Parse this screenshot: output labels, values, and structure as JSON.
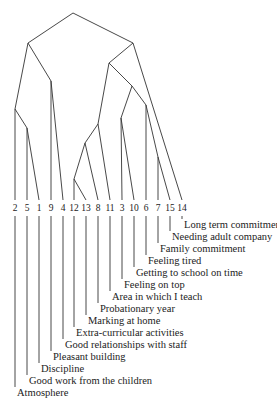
{
  "diagram": {
    "type": "dendrogram",
    "leaves": [
      {
        "id": "2",
        "x": 15,
        "label": "Atmosphere",
        "label_y": 396
      },
      {
        "id": "5",
        "x": 27,
        "label": "Good work from the children",
        "label_y": 384
      },
      {
        "id": "1",
        "x": 39,
        "label": "Discipline",
        "label_y": 372
      },
      {
        "id": "9",
        "x": 51,
        "label": "Pleasant building",
        "label_y": 360
      },
      {
        "id": "4",
        "x": 63,
        "label": "Good relationships with staff",
        "label_y": 348
      },
      {
        "id": "12",
        "x": 74,
        "label": "Extra-curricular activities",
        "label_y": 336
      },
      {
        "id": "13",
        "x": 86,
        "label": "Marking at home",
        "label_y": 324
      },
      {
        "id": "8",
        "x": 98,
        "label": "Probationary year",
        "label_y": 312
      },
      {
        "id": "11",
        "x": 110,
        "label": "Area in which I teach",
        "label_y": 300
      },
      {
        "id": "3",
        "x": 122,
        "label": "Feeling on top",
        "label_y": 288
      },
      {
        "id": "10",
        "x": 134,
        "label": "Getting to school on time",
        "label_y": 276
      },
      {
        "id": "6",
        "x": 146,
        "label": "Feeling tired",
        "label_y": 264
      },
      {
        "id": "7",
        "x": 158,
        "label": "Family commitment",
        "label_y": 252
      },
      {
        "id": "15",
        "x": 170,
        "label": "Needing adult company",
        "label_y": 240
      },
      {
        "id": "14",
        "x": 182,
        "label": "Long term commitment",
        "label_y": 228
      }
    ],
    "leaf_top_y": 200,
    "leaf_num_y": 211,
    "stem_start_y": 216,
    "nodes": [
      {
        "name": "root",
        "x": 73,
        "y": 13,
        "children": [
          "left",
          "right"
        ]
      },
      {
        "name": "left",
        "x": 28,
        "y": 43,
        "children": [
          "n_2_5_1",
          "n_9_4"
        ]
      },
      {
        "name": "n_2_5_1",
        "x": 15,
        "y": 109,
        "children": [
          "leaf:2",
          "n_5_1"
        ]
      },
      {
        "name": "n_5_1",
        "x": 27,
        "y": 128,
        "children": [
          "leaf:5",
          "leaf:1"
        ]
      },
      {
        "name": "n_9_4",
        "x": 51,
        "y": 81,
        "children": [
          "leaf:9",
          "leaf:4"
        ]
      },
      {
        "name": "right",
        "x": 133,
        "y": 43,
        "children": [
          "r_sub",
          "leaf:14"
        ]
      },
      {
        "name": "r_sub",
        "x": 109,
        "y": 63,
        "children": [
          "n_12_13_8_11",
          "n_3_10_6_7_15"
        ]
      },
      {
        "name": "n_12_13_8_11",
        "x": 98,
        "y": 124,
        "children": [
          "n_12_13_8",
          "leaf:11"
        ]
      },
      {
        "name": "n_12_13_8",
        "x": 85,
        "y": 143,
        "children": [
          "n_12_13",
          "leaf:8"
        ]
      },
      {
        "name": "n_12_13",
        "x": 74,
        "y": 179,
        "children": [
          "leaf:12",
          "leaf:13"
        ]
      },
      {
        "name": "n_3_10_6_7_15",
        "x": 132,
        "y": 86,
        "children": [
          "n_3_10",
          "n_6_7_15"
        ]
      },
      {
        "name": "n_3_10",
        "x": 121,
        "y": 118,
        "children": [
          "leaf:3",
          "leaf:10"
        ]
      },
      {
        "name": "n_6_7_15",
        "x": 146,
        "y": 105,
        "children": [
          "leaf:6",
          "n_7_15"
        ]
      },
      {
        "name": "n_7_15",
        "x": 158,
        "y": 157,
        "children": [
          "leaf:7",
          "leaf:15"
        ]
      }
    ]
  }
}
